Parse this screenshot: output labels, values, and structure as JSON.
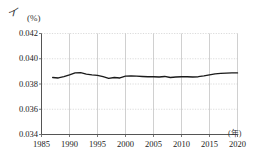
{
  "figure": {
    "panel_label": "イ",
    "y_unit": "(%)",
    "x_unit": "(年)"
  },
  "chart_data": {
    "type": "line",
    "title": "",
    "subtitle": "",
    "xlabel": "(年)",
    "ylabel": "(%)",
    "xlim": [
      1985,
      2020
    ],
    "ylim": [
      0.034,
      0.042
    ],
    "grid": true,
    "legend": null,
    "x_ticks": [
      1985,
      1990,
      1995,
      2000,
      2005,
      2010,
      2015,
      2020
    ],
    "y_ticks": [
      "0.034",
      "0.036",
      "0.038",
      "0.040",
      "0.042"
    ],
    "y_tick_values": [
      0.034,
      0.036,
      0.038,
      0.04,
      0.042
    ],
    "series": [
      {
        "name": "",
        "color": "#1a1a1a",
        "x": [
          1987,
          1988,
          1989,
          1990,
          1991,
          1992,
          1993,
          1994,
          1995,
          1996,
          1997,
          1998,
          1999,
          2000,
          2001,
          2002,
          2003,
          2004,
          2005,
          2006,
          2007,
          2008,
          2009,
          2010,
          2011,
          2012,
          2013,
          2014,
          2015,
          2016,
          2017,
          2018,
          2019,
          2020
        ],
        "values": [
          0.03852,
          0.03848,
          0.03858,
          0.03872,
          0.03888,
          0.0389,
          0.03878,
          0.03872,
          0.03868,
          0.03858,
          0.03845,
          0.03852,
          0.03848,
          0.03862,
          0.03864,
          0.03862,
          0.0386,
          0.03858,
          0.03858,
          0.03856,
          0.0386,
          0.03852,
          0.03856,
          0.03858,
          0.03858,
          0.03856,
          0.03858,
          0.03864,
          0.03872,
          0.0388,
          0.03884,
          0.03886,
          0.03888,
          0.03888
        ]
      }
    ]
  }
}
